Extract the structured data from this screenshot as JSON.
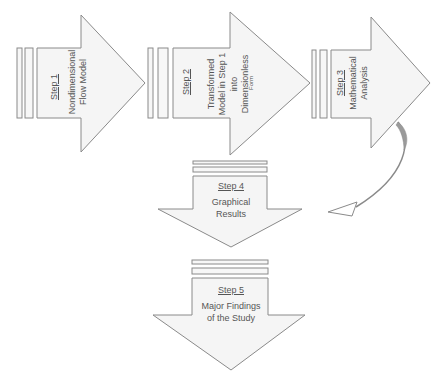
{
  "diagram": {
    "type": "process-flow",
    "steps": [
      {
        "id": 1,
        "step_label": "Step 1",
        "lines": [
          "Nondimensional",
          "Flow Model"
        ],
        "direction": "right"
      },
      {
        "id": 2,
        "step_label": "Step 2",
        "lines": [
          "Transformed",
          "Model in Step 1",
          "into",
          "Dimensionless"
        ],
        "small_line": "Form",
        "direction": "right"
      },
      {
        "id": 3,
        "step_label": "Step 3",
        "lines": [
          "Mathematical",
          "Analysis"
        ],
        "direction": "right"
      },
      {
        "id": 4,
        "step_label": "Step 4",
        "lines": [
          "Graphical",
          "Results"
        ],
        "direction": "down"
      },
      {
        "id": 5,
        "step_label": "Step 5",
        "lines": [
          "Major Findings",
          "of the Study"
        ],
        "direction": "down"
      }
    ],
    "connectors": [
      {
        "from": 3,
        "to": 4,
        "style": "curved-arrow"
      }
    ],
    "colors": {
      "fill": "#f5f5f5",
      "stroke": "#8a8a8a",
      "text": "#555555",
      "connector": "#9a9a9a"
    }
  }
}
